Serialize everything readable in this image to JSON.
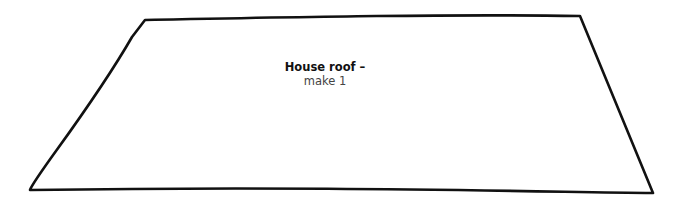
{
  "piece": {
    "title": "House roof –",
    "instruction": "make 1",
    "shape": "trapezoid",
    "stroke_color": "#111111",
    "fill_color": "#ffffff"
  }
}
